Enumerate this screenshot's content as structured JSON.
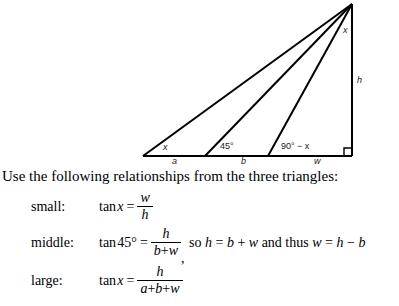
{
  "diagram": {
    "name": "right-triangle-with-two-cevians",
    "apex_angle_label": "x",
    "height_label": "h",
    "base_angles": [
      "x",
      "45°",
      "90° − x"
    ],
    "base_segments": [
      "a",
      "b",
      "w"
    ],
    "right_angle_marker": "right-angle",
    "stroke_color": "#000000",
    "background_color": "#ffffff"
  },
  "prose": {
    "intro": "Use the following relationships from the three triangles:"
  },
  "equations": [
    {
      "tag": "small:",
      "lhs_func": "tan",
      "lhs_arg": "x",
      "equals": "=",
      "numerator": "w",
      "denominator": "h",
      "tail": ""
    },
    {
      "tag": "middle:",
      "lhs_func": "tan",
      "lhs_arg": "45°",
      "equals": "=",
      "numerator": "h",
      "denominator_parts": [
        "b",
        "+",
        "w"
      ],
      "comma": ",",
      "tail_parts": [
        "so",
        "h",
        "=",
        "b",
        "+",
        "w",
        "and thus",
        "w",
        "=",
        "h",
        "−",
        "b"
      ]
    },
    {
      "tag": "large:",
      "lhs_func": "tan",
      "lhs_arg": "x",
      "equals": "=",
      "numerator": "h",
      "denominator_parts": [
        "a",
        "+",
        "b",
        "+",
        "w"
      ],
      "tail": ""
    }
  ]
}
